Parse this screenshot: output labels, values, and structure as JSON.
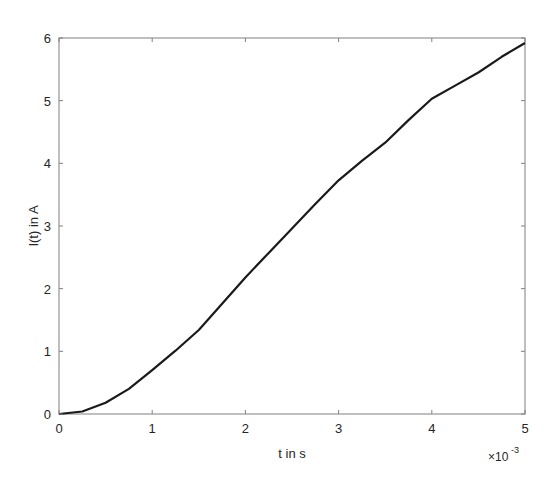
{
  "chart_data": {
    "type": "line",
    "title": "",
    "xlabel": "t in s",
    "ylabel": "I(t) in A",
    "x_exponent_label": "×10",
    "x_exponent_power": "-3",
    "xlim": [
      0,
      5
    ],
    "ylim": [
      0,
      6
    ],
    "grid": false,
    "legend": null,
    "x_ticks": [
      0,
      1,
      2,
      3,
      4,
      5
    ],
    "x_tick_labels": [
      "0",
      "1",
      "2",
      "3",
      "4",
      "5"
    ],
    "y_ticks": [
      0,
      1,
      2,
      3,
      4,
      5,
      6
    ],
    "y_tick_labels": [
      "0",
      "1",
      "2",
      "3",
      "4",
      "5",
      "6"
    ],
    "x_unit_scale": 0.001,
    "series": [
      {
        "name": "I(t)",
        "color": "#1a1a1a",
        "x": [
          0,
          0.25,
          0.5,
          0.75,
          1.0,
          1.25,
          1.5,
          1.75,
          2.0,
          2.25,
          2.5,
          2.75,
          3.0,
          3.25,
          3.5,
          3.75,
          4.0,
          4.25,
          4.5,
          4.75,
          5.0
        ],
        "values": [
          0,
          0.04,
          0.18,
          0.4,
          0.7,
          1.01,
          1.34,
          1.76,
          2.18,
          2.57,
          2.96,
          3.35,
          3.73,
          4.04,
          4.33,
          4.69,
          5.03,
          5.24,
          5.45,
          5.7,
          5.92
        ]
      }
    ]
  },
  "colors": {
    "axis": "#808080",
    "background": "#ffffff",
    "line": "#1a1a1a"
  }
}
